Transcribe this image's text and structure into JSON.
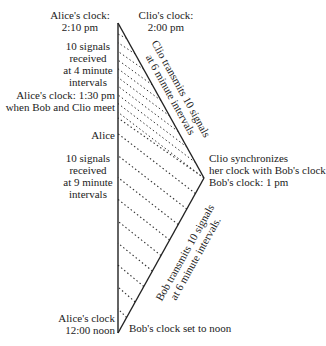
{
  "labels": {
    "alice_clock_top": [
      "Alice's clock:",
      "2:10 pm"
    ],
    "clio_clock_top": [
      "Clio's clock:",
      "2:00 pm"
    ],
    "alice_received_4": [
      "10 signals",
      "received",
      "at 4 minute",
      "intervals"
    ],
    "alice_meet": [
      "Alice's clock: 1:30 pm",
      "when Bob and Clio meet"
    ],
    "alice": "Alice",
    "alice_received_9": [
      "10 signals",
      "received",
      "at 9 minute",
      "intervals"
    ],
    "alice_clock_bottom": [
      "Alice's clock",
      "12:00 noon"
    ],
    "clio_sync": [
      "Clio synchronizes",
      "her clock with Bob's clock",
      "Bob's clock: 1 pm"
    ],
    "bob_start": "Bob's clock set to noon",
    "clio_transmits": [
      "Clio transmits 10 signals",
      "at 6 minute intervals"
    ],
    "bob_transmits": [
      "Bob transmits 10 signals",
      "at 6 minute intervals."
    ]
  },
  "geometry": {
    "alice_top": [
      118,
      23
    ],
    "alice_bottom": [
      118,
      333
    ],
    "meet_vertex": [
      204,
      178
    ],
    "alice_meet_y": 114,
    "signal_count": 10,
    "line_color": "#222222"
  }
}
